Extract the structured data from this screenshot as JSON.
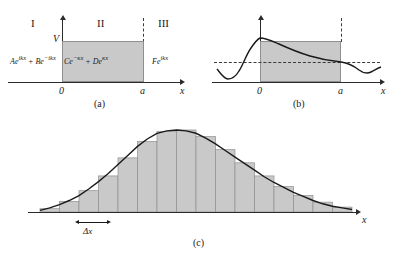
{
  "figure": {
    "panels": [
      {
        "id": "a",
        "caption": "(a)",
        "regions": [
          {
            "numeral": "I",
            "wavefunction_base": "Ae",
            "wavefunction_exp": "ikx",
            "wavefunction_base2": " + Be",
            "wavefunction_exp2": "−ikx"
          },
          {
            "numeral": "II",
            "wavefunction_base": "Ce",
            "wavefunction_exp": "−κx",
            "wavefunction_base2": " + De",
            "wavefunction_exp2": "κx"
          },
          {
            "numeral": "III",
            "wavefunction_base": "Fe",
            "wavefunction_exp": "ikx",
            "wavefunction_base2": "",
            "wavefunction_exp2": ""
          }
        ],
        "potential_label": "V",
        "x_axis_label": "x",
        "tick_left": "0",
        "tick_right": "a"
      },
      {
        "id": "b",
        "caption": "(b)",
        "x_axis_label": "x",
        "tick_left": "0",
        "tick_right": "a"
      },
      {
        "id": "c",
        "caption": "(c)",
        "x_axis_label": "x",
        "bin_width_label": "Δx"
      }
    ]
  },
  "colors": {
    "barrier_fill": "#c9c9c9",
    "barrier_stroke": "#8f8f8f",
    "ink": "#1a1a1a",
    "background": "#ffffff"
  },
  "chart_data": [
    {
      "type": "line",
      "id": "panel-b-wavefunction",
      "title": "",
      "xlabel": "x",
      "ylabel": "",
      "xlim": [
        -1.35,
        1.9
      ],
      "ylim": [
        -1.0,
        1.25
      ],
      "grid": false,
      "annotations": [
        "dashed horizontal reference line at y=0",
        "barrier region shaded between x=0 and x=a"
      ],
      "barrier_x": [
        0,
        1
      ],
      "x": [
        -1.35,
        -1.25,
        -1.15,
        -1.05,
        -0.95,
        -0.85,
        -0.75,
        -0.65,
        -0.55,
        -0.45,
        -0.35,
        -0.25,
        -0.15,
        -0.05,
        0.0,
        0.1,
        0.2,
        0.3,
        0.4,
        0.5,
        0.6,
        0.7,
        0.8,
        0.9,
        1.0,
        1.1,
        1.2,
        1.3,
        1.4,
        1.5,
        1.6,
        1.7,
        1.8,
        1.9
      ],
      "y": [
        -0.12,
        -0.38,
        -0.62,
        -0.74,
        -0.76,
        -0.7,
        -0.52,
        -0.2,
        0.22,
        0.6,
        0.85,
        0.98,
        1.04,
        1.06,
        1.05,
        0.96,
        0.86,
        0.76,
        0.66,
        0.56,
        0.46,
        0.37,
        0.3,
        0.24,
        0.2,
        0.14,
        0.02,
        -0.14,
        -0.26,
        -0.3,
        -0.26,
        -0.16,
        -0.08,
        -0.06
      ]
    },
    {
      "type": "bar",
      "id": "panel-c-probability-histogram",
      "title": "",
      "xlabel": "x",
      "ylabel": "",
      "grid": false,
      "annotations": [
        "smooth bell-shaped envelope curve overlaid on histogram",
        "double-headed arrow marks one bin width Δx"
      ],
      "bin_width_label": "Δx",
      "categories": [
        "1",
        "2",
        "3",
        "4",
        "5",
        "6",
        "7",
        "8",
        "9",
        "10",
        "11",
        "12",
        "13",
        "14",
        "15",
        "16"
      ],
      "values": [
        0.04,
        0.13,
        0.26,
        0.44,
        0.66,
        0.86,
        0.98,
        1.0,
        0.92,
        0.76,
        0.6,
        0.44,
        0.31,
        0.2,
        0.12,
        0.06
      ],
      "envelope_x": [
        0.0,
        0.5,
        1.0,
        1.5,
        2.0,
        2.5,
        3.0,
        3.5,
        4.0,
        4.5,
        5.0,
        5.5,
        6.0,
        6.5,
        7.0,
        7.5,
        8.0,
        8.5,
        9.0,
        9.5,
        10.0,
        10.5,
        11.0,
        11.5,
        12.0,
        12.5,
        13.0,
        13.5,
        14.0,
        14.5,
        15.0,
        15.5,
        16.0
      ],
      "envelope_y": [
        0.02,
        0.05,
        0.09,
        0.14,
        0.2,
        0.28,
        0.37,
        0.47,
        0.58,
        0.69,
        0.8,
        0.89,
        0.96,
        0.99,
        1.0,
        0.99,
        0.96,
        0.9,
        0.83,
        0.75,
        0.67,
        0.59,
        0.51,
        0.43,
        0.36,
        0.3,
        0.24,
        0.19,
        0.14,
        0.1,
        0.07,
        0.05,
        0.03
      ]
    }
  ]
}
